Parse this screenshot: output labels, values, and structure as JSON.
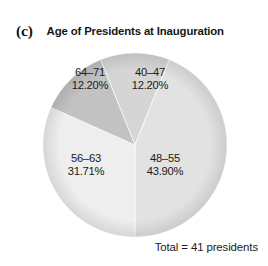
{
  "panel": {
    "letter": "(c)",
    "title": "Age of Presidents at Inauguration"
  },
  "footer": {
    "total_note": "Total = 41 presidents"
  },
  "chart_data": {
    "type": "pie",
    "title": "Age of Presidents at Inauguration",
    "panel_label": "(c)",
    "total_label": "Total = 41 presidents",
    "total": 41,
    "unit": "presidents",
    "xlabel": "",
    "ylabel": "",
    "legend": "none",
    "labels_inside_slices": true,
    "start_angle_deg": -22,
    "direction": "clockwise",
    "categories": [
      "40–47",
      "48–55",
      "56–63",
      "64–71"
    ],
    "values": [
      12.2,
      43.9,
      31.71,
      12.2
    ],
    "counts": [
      5,
      18,
      13,
      5
    ],
    "value_suffix": "%",
    "colors": [
      "#d5d5d5",
      "#e2e2e2",
      "#eeeeee",
      "#c2c2c2"
    ],
    "slices": [
      {
        "label": "40–47",
        "range_text": "40–47",
        "percent_text": "12.20%",
        "value": 12.2,
        "count": 5,
        "color": "#d5d5d5"
      },
      {
        "label": "48–55",
        "range_text": "48–55",
        "percent_text": "43.90%",
        "value": 43.9,
        "count": 18,
        "color": "#e2e2e2"
      },
      {
        "label": "56–63",
        "range_text": "56–63",
        "percent_text": "31.71%",
        "value": 31.71,
        "count": 13,
        "color": "#eeeeee"
      },
      {
        "label": "64–71",
        "range_text": "64–71",
        "percent_text": "12.20%",
        "value": 12.2,
        "count": 5,
        "color": "#c2c2c2"
      }
    ]
  }
}
